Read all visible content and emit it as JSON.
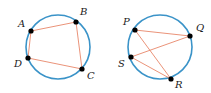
{
  "colors": {
    "circle": "#3a93c8",
    "chord": "#e8876a",
    "point": "#000000",
    "label": "#1a1a1a"
  },
  "figures": [
    {
      "name": "quadrilateral-ABCD",
      "circle": {
        "cx": 58,
        "cy": 47,
        "r": 32
      },
      "points": [
        {
          "label": "A",
          "x": 31,
          "y": 31,
          "lx": 18,
          "ly": 27
        },
        {
          "label": "B",
          "x": 76,
          "y": 22,
          "lx": 80,
          "ly": 15
        },
        {
          "label": "C",
          "x": 82,
          "y": 69,
          "lx": 87,
          "ly": 79
        },
        {
          "label": "D",
          "x": 28,
          "y": 58,
          "lx": 14,
          "ly": 67
        }
      ],
      "segments": [
        [
          "A",
          "B"
        ],
        [
          "B",
          "C"
        ],
        [
          "C",
          "D"
        ],
        [
          "D",
          "A"
        ]
      ]
    },
    {
      "name": "chords-PQRS",
      "circle": {
        "cx": 160,
        "cy": 47,
        "r": 32
      },
      "points": [
        {
          "label": "P",
          "x": 135,
          "y": 30,
          "lx": 123,
          "ly": 25
        },
        {
          "label": "Q",
          "x": 190,
          "y": 36,
          "lx": 196,
          "ly": 31
        },
        {
          "label": "R",
          "x": 171,
          "y": 79,
          "lx": 175,
          "ly": 88
        },
        {
          "label": "S",
          "x": 131,
          "y": 57,
          "lx": 118,
          "ly": 67
        }
      ],
      "segments": [
        [
          "P",
          "Q"
        ],
        [
          "P",
          "R"
        ],
        [
          "S",
          "Q"
        ],
        [
          "S",
          "R"
        ]
      ]
    }
  ]
}
